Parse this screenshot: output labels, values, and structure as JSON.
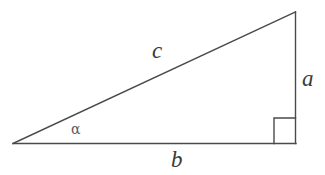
{
  "diagram": {
    "type": "right-triangle",
    "background_color": "#ffffff",
    "stroke_color": "#4a4a4a",
    "label_color": "#3a3a3a",
    "angle_label_color": "#5c5c5c",
    "stroke_width": 1.4,
    "vertices": {
      "left": {
        "x": 13,
        "y": 143.5
      },
      "apex": {
        "x": 295.5,
        "y": 12
      },
      "right": {
        "x": 295.5,
        "y": 143.5
      }
    },
    "edges": [
      {
        "name": "hypotenuse",
        "label": "c",
        "from": "left",
        "to": "apex"
      },
      {
        "name": "opposite-side",
        "label": "a",
        "from": "apex",
        "to": "right"
      },
      {
        "name": "adjacent-side",
        "label": "b",
        "from": "left",
        "to": "right"
      }
    ],
    "right_angle_marker": {
      "name": "right-angle-square",
      "x": 274,
      "y": 118,
      "size": 22
    },
    "labels": {
      "hypotenuse": "c",
      "vertical_side": "a",
      "base_side": "b",
      "angle": "α"
    }
  }
}
